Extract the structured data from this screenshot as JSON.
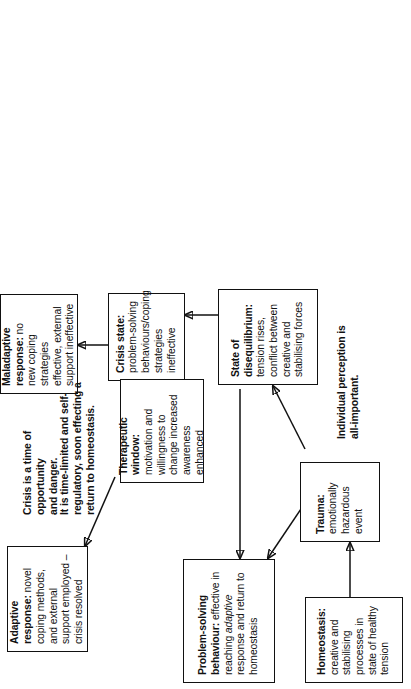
{
  "diagram": {
    "orientation": "rotated-90-ccw",
    "nodes": [
      {
        "id": "homeostasis",
        "name": "homeostasis",
        "heading": "Homeostasis:",
        "body": " creative and stabilising processes in state of healthy tension"
      },
      {
        "id": "trauma",
        "name": "trauma",
        "heading": "Trauma:",
        "body": " emotionally hazardous event"
      },
      {
        "id": "problem-solving-behaviour",
        "name": "problem-solving-behaviour",
        "heading": "Problem-solving behaviour:",
        "body_pre": " effective in reaching ",
        "body_italic": "adaptive",
        "body_post": " response and return to homeostasis"
      },
      {
        "id": "state-of-disequilibrium",
        "name": "state-of-disequilibrium",
        "heading": "State of disequilibrium:",
        "body": " tension rises, conflict between creative and stabilising forces"
      },
      {
        "id": "crisis-state",
        "name": "crisis-state",
        "heading": "Crisis state:",
        "body": " problem-solving behaviours/coping strategies ineffective"
      },
      {
        "id": "maladaptive-response",
        "name": "maladaptive-response",
        "heading": "Maladaptive response:",
        "body": " no new coping strategies effective, external support ineffective"
      },
      {
        "id": "therapeutic-window",
        "name": "therapeutic-window",
        "heading": "Therapeutic window:",
        "body": " motivation and willingness to change increased awareness enhanced"
      },
      {
        "id": "adaptive-response",
        "name": "adaptive-response",
        "heading": "Adaptive response:",
        "body": " novel coping methods, and external support employed – crisis resolved"
      }
    ],
    "notes": [
      {
        "id": "note-crisis",
        "name": "note-crisis-opportunity-danger",
        "line1": "Crisis is a time of opportunity",
        "line2": "and danger."
      },
      {
        "id": "note-time-limited",
        "name": "note-time-limited",
        "line1": "It is time-limited and self-",
        "line2": "regulatory, soon effecting a",
        "line3": "return to homeostasis."
      },
      {
        "id": "note-perception",
        "name": "note-individual-perception",
        "line1": "Individual perception is",
        "line2": "all-important."
      }
    ],
    "edges": [
      {
        "from": "homeostasis",
        "to": "trauma",
        "kind": "straight"
      },
      {
        "from": "trauma",
        "to": "problem-solving-behaviour",
        "kind": "diagonal"
      },
      {
        "from": "trauma",
        "to": "state-of-disequilibrium",
        "kind": "diagonal"
      },
      {
        "from": "state-of-disequilibrium",
        "to": "problem-solving-behaviour",
        "kind": "straight"
      },
      {
        "from": "state-of-disequilibrium",
        "to": "crisis-state",
        "kind": "straight"
      },
      {
        "from": "crisis-state",
        "to": "maladaptive-response",
        "kind": "straight"
      },
      {
        "from": "crisis-state",
        "to": "therapeutic-window",
        "kind": "straight"
      },
      {
        "from": "therapeutic-window",
        "to": "adaptive-response",
        "kind": "diagonal"
      }
    ],
    "colors": {
      "ink": "#111111",
      "paper": "#ffffff"
    }
  }
}
